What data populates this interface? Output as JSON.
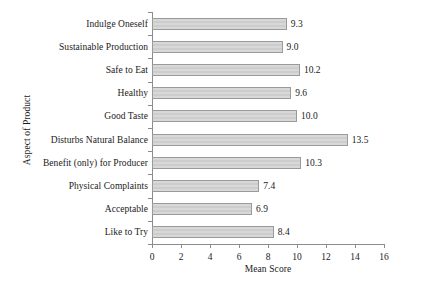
{
  "chart_data": {
    "type": "bar",
    "orientation": "horizontal",
    "title": "",
    "xlabel": "Mean Score",
    "ylabel": "Aspect of Product",
    "xlim": [
      0,
      16
    ],
    "ylim": null,
    "grid": false,
    "legend": null,
    "xticks": [
      0,
      2,
      4,
      6,
      8,
      10,
      12,
      14,
      16
    ],
    "xtick_labels": [
      "0",
      "2",
      "4",
      "6",
      "8",
      "10",
      "12",
      "14",
      "16"
    ],
    "categories": [
      "Indulge Oneself",
      "Sustainable Production",
      "Safe to Eat",
      "Healthy",
      "Good Taste",
      "Disturbs Natural Balance",
      "Benefit (only) for Producer",
      "Physical Complaints",
      "Acceptable",
      "Like to Try"
    ],
    "values": [
      9.3,
      9.0,
      10.2,
      9.6,
      10.0,
      13.5,
      10.3,
      7.4,
      6.9,
      8.4
    ],
    "value_labels": [
      "9.3",
      "9.0",
      "10.2",
      "9.6",
      "10.0",
      "13.5",
      "10.3",
      "7.4",
      "6.9",
      "8.4"
    ],
    "colors": {
      "bar_fill": "#d2d2d2",
      "bar_stroke": "#9a9a9a",
      "axis": "#8c8c8c",
      "text": "#1a1a1a",
      "background": "#ffffff"
    }
  }
}
